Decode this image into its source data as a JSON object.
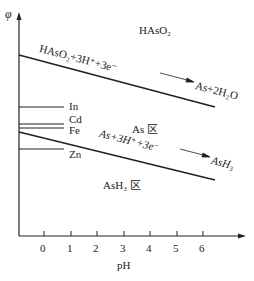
{
  "axes": {
    "y_label": "φ",
    "x_label": "pH",
    "x_ticks": [
      "0",
      "1",
      "2",
      "3",
      "4",
      "5",
      "6"
    ]
  },
  "regions": {
    "top": "HAsO₂",
    "middle": "As 区",
    "bottom": "AsH₃ 区"
  },
  "reactions": {
    "upper": {
      "left": "HAsO₂+3H⁺+3e⁻",
      "right": "As+2H₂O"
    },
    "lower": {
      "left": "As+3H⁺+3e⁻",
      "right": "AsH₃"
    }
  },
  "metals": [
    {
      "name": "In",
      "y": 107
    },
    {
      "name": "Cd",
      "y": 124
    },
    {
      "name": "Fe",
      "y": 128
    },
    {
      "name": "Zn",
      "y": 149
    }
  ],
  "colors": {
    "line": "#222222",
    "background": "#ffffff"
  }
}
